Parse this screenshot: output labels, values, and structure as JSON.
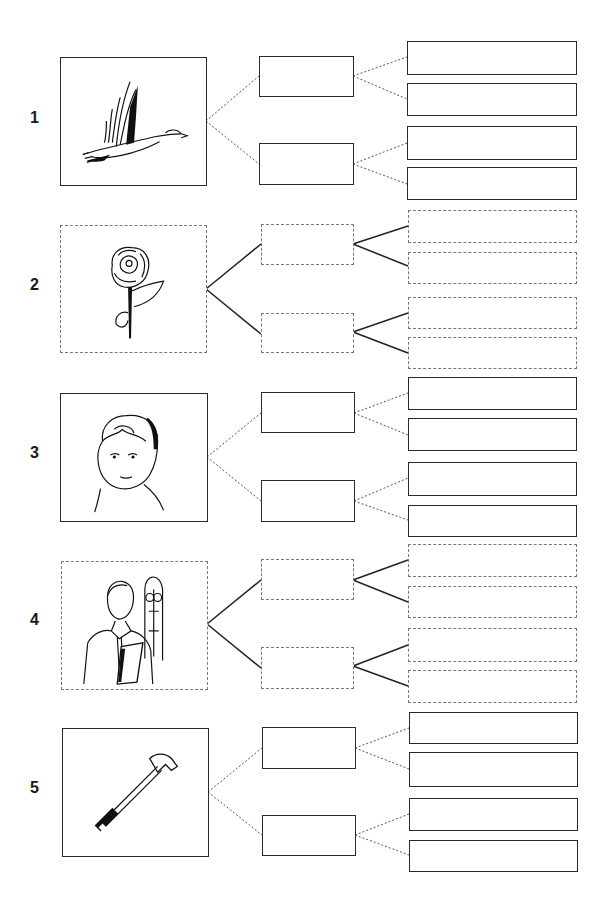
{
  "worksheet": {
    "rows": [
      {
        "number": "1",
        "picture": "flying-duck",
        "style": "solid",
        "connector": "dotted"
      },
      {
        "number": "2",
        "picture": "rose",
        "style": "dashed",
        "connector": "solid"
      },
      {
        "number": "3",
        "picture": "child-face",
        "style": "solid",
        "connector": "dotted"
      },
      {
        "number": "4",
        "picture": "priest-with-book",
        "style": "dashed",
        "connector": "solid"
      },
      {
        "number": "5",
        "picture": "hammer",
        "style": "solid",
        "connector": "dotted"
      }
    ]
  }
}
